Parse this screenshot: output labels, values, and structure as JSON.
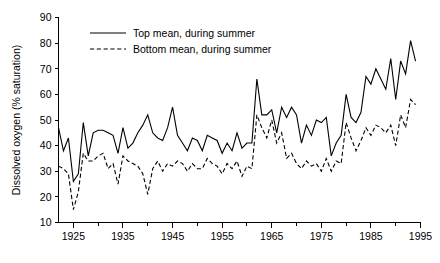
{
  "chart_data": {
    "type": "line",
    "title": "",
    "xlabel": "",
    "ylabel": "Dissolved oxygen (% saturation)",
    "xlim": [
      1922,
      1995
    ],
    "ylim": [
      10,
      90
    ],
    "xticks": [
      1925,
      1935,
      1945,
      1955,
      1965,
      1975,
      1985,
      1995
    ],
    "xtick_labels": [
      "1925",
      "1935",
      "1945",
      "1955",
      "1965",
      "1975",
      "1985",
      "1995"
    ],
    "xminorticks": [
      1930,
      1940,
      1950,
      1960,
      1970,
      1980,
      1990
    ],
    "yticks": [
      10,
      20,
      30,
      40,
      50,
      60,
      70,
      80,
      90
    ],
    "ytick_labels": [
      "10",
      "20",
      "30",
      "40",
      "50",
      "60",
      "70",
      "80",
      "90"
    ],
    "grid": false,
    "legend_position": "top-left",
    "x": [
      1922,
      1923,
      1924,
      1925,
      1926,
      1927,
      1928,
      1929,
      1930,
      1931,
      1932,
      1933,
      1934,
      1935,
      1936,
      1937,
      1938,
      1939,
      1940,
      1941,
      1942,
      1943,
      1944,
      1945,
      1946,
      1947,
      1948,
      1949,
      1950,
      1951,
      1952,
      1953,
      1954,
      1955,
      1956,
      1957,
      1958,
      1959,
      1960,
      1961,
      1962,
      1963,
      1964,
      1965,
      1966,
      1967,
      1968,
      1969,
      1970,
      1971,
      1972,
      1973,
      1974,
      1975,
      1976,
      1977,
      1978,
      1979,
      1980,
      1981,
      1982,
      1983,
      1984,
      1985,
      1986,
      1987,
      1988,
      1989,
      1990,
      1991,
      1992,
      1993,
      1994
    ],
    "series": [
      {
        "name": "Top mean, during summer",
        "style": "solid",
        "color": "#000000",
        "values": [
          47,
          38,
          43,
          26,
          29,
          49,
          36,
          45,
          46,
          46,
          45,
          44,
          37,
          47,
          39,
          41,
          45,
          48,
          52,
          45,
          43,
          42,
          47,
          55,
          44,
          41,
          38,
          43,
          42,
          38,
          44,
          43,
          42,
          37,
          41,
          38,
          45,
          39,
          41,
          41,
          66,
          52,
          52,
          54,
          45,
          55,
          51,
          55,
          52,
          41,
          48,
          44,
          50,
          49,
          51,
          36,
          41,
          44,
          60,
          51,
          49,
          53,
          67,
          64,
          70,
          66,
          62,
          74,
          58,
          73,
          68,
          81,
          73
        ]
      },
      {
        "name": "Bottom mean, during summer",
        "style": "dashed",
        "color": "#000000",
        "values": [
          32,
          31,
          29,
          15,
          22,
          37,
          34,
          34,
          36,
          37,
          31,
          33,
          25,
          36,
          34,
          33,
          32,
          29,
          21,
          31,
          34,
          30,
          33,
          32,
          34,
          33,
          30,
          33,
          31,
          31,
          35,
          33,
          32,
          29,
          33,
          31,
          34,
          28,
          32,
          31,
          52,
          47,
          43,
          50,
          41,
          45,
          35,
          37,
          33,
          31,
          34,
          32,
          33,
          30,
          35,
          30,
          34,
          33,
          49,
          43,
          38,
          42,
          47,
          44,
          48,
          47,
          45,
          48,
          40,
          52,
          47,
          58,
          56
        ]
      }
    ],
    "legend": [
      {
        "label": "Top mean, during summer",
        "style": "solid"
      },
      {
        "label": "Bottom mean, during summer",
        "style": "dashed"
      }
    ]
  }
}
